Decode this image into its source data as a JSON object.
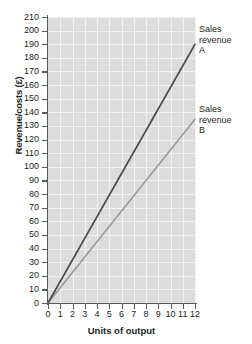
{
  "chart_data": {
    "type": "line",
    "title": "",
    "xlabel": "Units of output",
    "ylabel": "Revenue/costs (£)",
    "xlim": [
      0,
      12
    ],
    "ylim": [
      0,
      210
    ],
    "grid": true,
    "legend_position": "inline-right",
    "x": [
      0,
      1,
      2,
      3,
      4,
      5,
      6,
      7,
      8,
      9,
      10,
      11,
      12
    ],
    "xticks": [
      "0",
      "1",
      "2",
      "3",
      "4",
      "5",
      "6",
      "7",
      "8",
      "9",
      "10",
      "11",
      "12"
    ],
    "yticks": [
      "0",
      "10",
      "20",
      "30",
      "40",
      "50",
      "60",
      "70",
      "80",
      "90",
      "100",
      "110",
      "120",
      "130",
      "140",
      "150",
      "160",
      "170",
      "180",
      "190",
      "200",
      "210"
    ],
    "series": [
      {
        "name": "Sales revenue A",
        "label": "Sales\nrevenue\nA",
        "color": "#4a4a4a",
        "values": [
          0,
          15.8,
          31.7,
          47.5,
          63.3,
          79.2,
          95.0,
          110.8,
          126.7,
          142.5,
          158.3,
          174.2,
          190
        ]
      },
      {
        "name": "Sales revenue B",
        "label": "Sales\nrevenue\nB",
        "color": "#9a9a9a",
        "values": [
          0,
          11.3,
          22.5,
          33.8,
          45.0,
          56.3,
          67.5,
          78.8,
          90.0,
          101.3,
          112.5,
          123.8,
          135
        ]
      }
    ],
    "colors": {
      "plot_background": "#dcdcdc",
      "gridline": "#f2f2f2",
      "axis": "#58595b",
      "text": "#231f20"
    }
  }
}
